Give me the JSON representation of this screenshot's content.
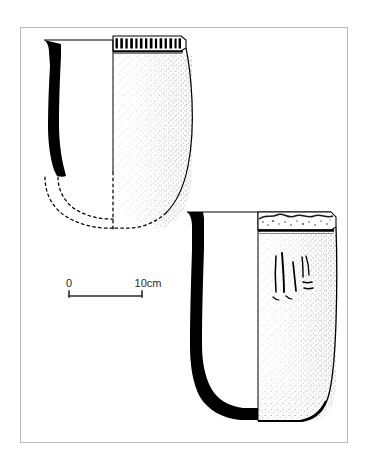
{
  "figure": {
    "type": "archaeological-pottery-illustration",
    "title": "",
    "caption": "",
    "background_color": "#ffffff",
    "ink_color": "#000000",
    "frame": {
      "name": "plate-border",
      "color": "#b9b9b9",
      "x": 20,
      "y": 27,
      "width": 328,
      "height": 416,
      "stroke_width": 1
    }
  },
  "scale_bar": {
    "name": "scale-bar",
    "start_label": "0",
    "end_label": "10cm",
    "unit": "cm",
    "length_value": 10,
    "x_start": 69,
    "x_end": 142,
    "y": 290,
    "color": "#2b2b2b"
  },
  "vessels": [
    {
      "id": "vessel-upper",
      "name": "upper-vessel-profile",
      "description": "Bucket-shaped vessel with dentate-impressed rim band, solid black wall section at left, stippled exterior at right, reconstructed base in dashed line",
      "rim_decoration": "dentate-notched-band",
      "rim_notch_count": 13,
      "base_reconstructed": true,
      "section_fill": "solid-black",
      "exterior_shading": "stipple"
    },
    {
      "id": "vessel-lower",
      "name": "lower-vessel-profile",
      "description": "Tall U-shaped vessel with eroded rim band, solid black wall section at left, stippled exterior at right with incised marks, rounded base",
      "rim_decoration": "eroded-applied-band",
      "incised_marks": true,
      "base_reconstructed": false,
      "section_fill": "solid-black",
      "exterior_shading": "stipple"
    }
  ]
}
